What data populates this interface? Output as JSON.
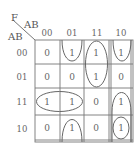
{
  "kmap": {
    "output_label": "F",
    "col_var_label": "AB",
    "row_var_label": "AB",
    "col_headers": [
      "00",
      "01",
      "11",
      "10"
    ],
    "row_headers": [
      "00",
      "01",
      "11",
      "10"
    ],
    "cells": [
      [
        "0",
        "1",
        "1",
        "1"
      ],
      [
        "0",
        "0",
        "1",
        "0"
      ],
      [
        "1",
        "1",
        "0",
        "1"
      ],
      [
        "0",
        "1",
        "0",
        "1"
      ]
    ],
    "groupings": [
      "col 01 wrap rows 10-00",
      "col 11 rows 00-01",
      "col 10 rows 00 (wrap top)",
      "row 11 cols 00-01",
      "col 10 rows 11-10",
      "col 10 row 10 single"
    ]
  }
}
